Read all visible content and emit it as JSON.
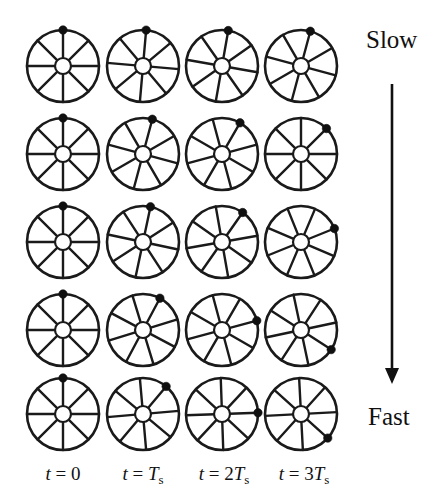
{
  "figure": {
    "background_color": "#ffffff",
    "ink_color": "#111111",
    "width": 444,
    "height": 504,
    "spokes_per_wheel": 8,
    "wheel_radius": 36,
    "hub_radius": 8,
    "marker_radius": 4.2
  },
  "speed_axis": {
    "top_label": "Slow",
    "bottom_label": "Fast",
    "arrow_direction": "down",
    "arrow_x": 392,
    "arrow_y_start": 84,
    "arrow_y_end": 384,
    "top_label_x": 366,
    "top_label_y": 48,
    "bottom_label_x": 368,
    "bottom_label_y": 425
  },
  "columns": [
    {
      "id": "t0",
      "center_x": 63,
      "label_parts": [
        {
          "text": "t",
          "style": "italic"
        },
        {
          "text": " = 0",
          "style": "upright"
        }
      ],
      "label_x": 63
    },
    {
      "id": "t1",
      "center_x": 143,
      "label_parts": [
        {
          "text": "t",
          "style": "italic"
        },
        {
          "text": " = ",
          "style": "upright"
        },
        {
          "text": "T",
          "style": "italic"
        },
        {
          "text": "s",
          "style": "sub"
        }
      ],
      "label_x": 143
    },
    {
      "id": "t2",
      "center_x": 222,
      "label_parts": [
        {
          "text": "t",
          "style": "italic"
        },
        {
          "text": " = 2",
          "style": "upright"
        },
        {
          "text": "T",
          "style": "italic"
        },
        {
          "text": "s",
          "style": "sub"
        }
      ],
      "label_x": 224
    },
    {
      "id": "t3",
      "center_x": 301,
      "label_parts": [
        {
          "text": "t",
          "style": "italic"
        },
        {
          "text": " = 3",
          "style": "upright"
        },
        {
          "text": "T",
          "style": "italic"
        },
        {
          "text": "s",
          "style": "sub"
        }
      ],
      "label_x": 304
    }
  ],
  "column_label_y": 480,
  "rows": [
    {
      "id": "row-1",
      "center_y": 66,
      "speed": "slowest",
      "degrees_per_sample": 5,
      "marker_angles_deg": [
        90,
        85,
        80,
        75
      ]
    },
    {
      "id": "row-2",
      "center_y": 154,
      "speed": "slow",
      "degrees_per_sample": 15,
      "marker_angles_deg": [
        90,
        75,
        60,
        45
      ]
    },
    {
      "id": "row-3",
      "center_y": 242,
      "speed": "medium",
      "degrees_per_sample": 22,
      "marker_angles_deg": [
        90,
        78,
        55,
        22
      ]
    },
    {
      "id": "row-4",
      "center_y": 330,
      "speed": "fast",
      "degrees_per_sample": 32,
      "marker_angles_deg": [
        90,
        62,
        15,
        -33
      ]
    },
    {
      "id": "row-5",
      "center_y": 414,
      "speed": "fastest",
      "degrees_per_sample": 45,
      "marker_angles_deg": [
        90,
        50,
        2,
        -42
      ]
    }
  ],
  "wheels": [
    {
      "row": 0,
      "col": 0,
      "marker_angle_deg": 90,
      "spoke_offset_deg": 0
    },
    {
      "row": 0,
      "col": 1,
      "marker_angle_deg": 85,
      "spoke_offset_deg": -5
    },
    {
      "row": 0,
      "col": 2,
      "marker_angle_deg": 80,
      "spoke_offset_deg": -10
    },
    {
      "row": 0,
      "col": 3,
      "marker_angle_deg": 75,
      "spoke_offset_deg": -15
    },
    {
      "row": 1,
      "col": 0,
      "marker_angle_deg": 90,
      "spoke_offset_deg": 0
    },
    {
      "row": 1,
      "col": 1,
      "marker_angle_deg": 75,
      "spoke_offset_deg": -15
    },
    {
      "row": 1,
      "col": 2,
      "marker_angle_deg": 60,
      "spoke_offset_deg": -30
    },
    {
      "row": 1,
      "col": 3,
      "marker_angle_deg": 45,
      "spoke_offset_deg": -45
    },
    {
      "row": 2,
      "col": 0,
      "marker_angle_deg": 90,
      "spoke_offset_deg": 0
    },
    {
      "row": 2,
      "col": 1,
      "marker_angle_deg": 78,
      "spoke_offset_deg": -12
    },
    {
      "row": 2,
      "col": 2,
      "marker_angle_deg": 55,
      "spoke_offset_deg": -35
    },
    {
      "row": 2,
      "col": 3,
      "marker_angle_deg": 22,
      "spoke_offset_deg": -68
    },
    {
      "row": 3,
      "col": 0,
      "marker_angle_deg": 90,
      "spoke_offset_deg": 0
    },
    {
      "row": 3,
      "col": 1,
      "marker_angle_deg": 62,
      "spoke_offset_deg": -28
    },
    {
      "row": 3,
      "col": 2,
      "marker_angle_deg": 15,
      "spoke_offset_deg": -75
    },
    {
      "row": 3,
      "col": 3,
      "marker_angle_deg": -33,
      "spoke_offset_deg": -123
    },
    {
      "row": 4,
      "col": 0,
      "marker_angle_deg": 90,
      "spoke_offset_deg": 0
    },
    {
      "row": 4,
      "col": 1,
      "marker_angle_deg": 50,
      "spoke_offset_deg": -40
    },
    {
      "row": 4,
      "col": 2,
      "marker_angle_deg": 2,
      "spoke_offset_deg": -88
    },
    {
      "row": 4,
      "col": 3,
      "marker_angle_deg": -42,
      "spoke_offset_deg": -132
    }
  ],
  "chart_data": {
    "type": "diagram",
    "x_axis": "sample time",
    "y_axis": "rotation speed",
    "categories": [
      "t = 0",
      "t = Ts",
      "t = 2Ts",
      "t = 3Ts"
    ],
    "series": [
      {
        "name": "Slowest row",
        "values": [
          90,
          85,
          80,
          75
        ]
      },
      {
        "name": "Slow row",
        "values": [
          90,
          75,
          60,
          45
        ]
      },
      {
        "name": "Medium row",
        "values": [
          90,
          78,
          55,
          22
        ]
      },
      {
        "name": "Fast row",
        "values": [
          90,
          62,
          15,
          -33
        ]
      },
      {
        "name": "Fastest row",
        "values": [
          90,
          50,
          2,
          -42
        ]
      }
    ],
    "units": "degrees (marker angle, CCW from +x axis)",
    "legend_position": "right",
    "annotations": [
      "Slow",
      "Fast"
    ]
  }
}
